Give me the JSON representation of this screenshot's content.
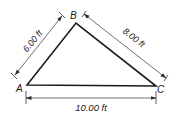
{
  "diagram": {
    "type": "triangle-dimensioned",
    "vertices": [
      {
        "id": "A",
        "label": "A",
        "x": 27,
        "y": 85
      },
      {
        "id": "B",
        "label": "B",
        "x": 76,
        "y": 23
      },
      {
        "id": "C",
        "label": "C",
        "x": 156,
        "y": 86
      }
    ],
    "sides": [
      {
        "from": "A",
        "to": "B",
        "length_label": "6.00 ft",
        "length": 6.0,
        "unit": "ft"
      },
      {
        "from": "B",
        "to": "C",
        "length_label": "8.00 ft",
        "length": 8.0,
        "unit": "ft"
      },
      {
        "from": "A",
        "to": "C",
        "length_label": "10.00 ft",
        "length": 10.0,
        "unit": "ft"
      }
    ],
    "colors": {
      "triangle_stroke": "#1a1a1a",
      "dimension_stroke": "#333333",
      "text": "#1a1a1a",
      "background": "#ffffff"
    }
  },
  "labels": {
    "vertex_a": "A",
    "vertex_b": "B",
    "vertex_c": "C",
    "side_ab": "6.00 ft",
    "side_bc": "8.00 ft",
    "side_ac": "10.00 ft"
  }
}
